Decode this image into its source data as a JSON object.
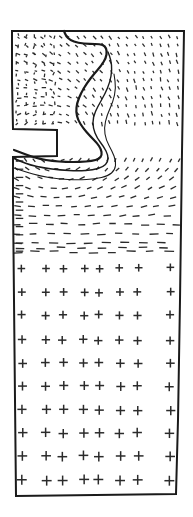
{
  "figure": {
    "title": "",
    "caption": "",
    "background_color": "#ffffff",
    "ink_color": "#1a1a1a",
    "domain_outline_color": "#1a1a1a",
    "glyph_color": "#2b2b2b"
  },
  "chart_data": {
    "type": "scatter",
    "title": "",
    "subtitle": "",
    "xlabel": "",
    "ylabel": "",
    "xlim": [
      0,
      193
    ],
    "ylim": [
      0,
      517
    ],
    "grid": false,
    "legend": null,
    "annotations": [],
    "boundary": {
      "name": "domain-outline",
      "stroke_width": 2.0,
      "closed": true,
      "points": [
        [
          12,
          31
        ],
        [
          184,
          31
        ],
        [
          182,
          152
        ],
        [
          180,
          300
        ],
        [
          178,
          420
        ],
        [
          176,
          494
        ],
        [
          16,
          496
        ],
        [
          15,
          400
        ],
        [
          14,
          300
        ],
        [
          13,
          200
        ],
        [
          13,
          157
        ],
        [
          57,
          156
        ],
        [
          57,
          130
        ],
        [
          13,
          129
        ],
        [
          12,
          80
        ],
        [
          12,
          31
        ]
      ]
    },
    "interior_curves": [
      {
        "name": "defect-curve-main",
        "stroke_width": 2.2,
        "points": [
          [
            64,
            31
          ],
          [
            66,
            36
          ],
          [
            70,
            40
          ],
          [
            78,
            43
          ],
          [
            90,
            44
          ],
          [
            100,
            44
          ],
          [
            105,
            46
          ],
          [
            107,
            51
          ],
          [
            106,
            58
          ],
          [
            101,
            66
          ],
          [
            94,
            74
          ],
          [
            87,
            83
          ],
          [
            81,
            93
          ],
          [
            77,
            103
          ],
          [
            76,
            112
          ],
          [
            78,
            120
          ],
          [
            83,
            128
          ],
          [
            90,
            136
          ],
          [
            97,
            143
          ],
          [
            101,
            149
          ],
          [
            102,
            155
          ],
          [
            99,
            159
          ],
          [
            92,
            161
          ],
          [
            80,
            162
          ],
          [
            66,
            162
          ],
          [
            52,
            161
          ],
          [
            40,
            159
          ],
          [
            30,
            156
          ],
          [
            22,
            153
          ],
          [
            14,
            150
          ]
        ]
      },
      {
        "name": "defect-curve-offset",
        "stroke_width": 1.4,
        "points": [
          [
            108,
            52
          ],
          [
            111,
            60
          ],
          [
            112,
            70
          ],
          [
            110,
            82
          ],
          [
            105,
            94
          ],
          [
            98,
            106
          ],
          [
            93,
            117
          ],
          [
            93,
            128
          ],
          [
            97,
            138
          ],
          [
            104,
            147
          ],
          [
            108,
            155
          ],
          [
            108,
            162
          ],
          [
            103,
            167
          ],
          [
            93,
            170
          ],
          [
            78,
            171
          ],
          [
            60,
            170
          ],
          [
            44,
            168
          ],
          [
            30,
            165
          ],
          [
            20,
            161
          ],
          [
            13,
            158
          ]
        ]
      },
      {
        "name": "defect-curve-outer",
        "stroke_width": 1.1,
        "points": [
          [
            114,
            74
          ],
          [
            116,
            88
          ],
          [
            113,
            102
          ],
          [
            107,
            115
          ],
          [
            104,
            128
          ],
          [
            106,
            140
          ],
          [
            112,
            151
          ],
          [
            116,
            161
          ],
          [
            115,
            170
          ],
          [
            108,
            176
          ],
          [
            95,
            179
          ],
          [
            78,
            180
          ],
          [
            58,
            179
          ],
          [
            40,
            176
          ],
          [
            26,
            172
          ],
          [
            14,
            168
          ]
        ]
      }
    ],
    "glyph_regions": [
      {
        "name": "upper-field-dots",
        "style": "short-steep-ticks",
        "glyph_length": 3.4,
        "stroke_width": 1.25,
        "description": "dense field of very short steeply-inclined ticks filling the notched upper block"
      },
      {
        "name": "fan-field-dashes",
        "style": "radial-dashes",
        "glyph_length": 6.5,
        "stroke_width": 1.3,
        "description": "fan of short dashes radiating around the notch tip, flattening to horizontal toward the lower rows"
      },
      {
        "name": "lower-field-crosses",
        "style": "plus-crosses",
        "glyph_length": 9.0,
        "stroke_width": 1.5,
        "rows_y": [
          268,
          292,
          315,
          340,
          363,
          386,
          410,
          433,
          456,
          480
        ],
        "cols_x": [
          22,
          46,
          63,
          84,
          99,
          120,
          138,
          170
        ],
        "description": "regular lattice of plus-shaped crosses in the lower half of the domain"
      }
    ]
  }
}
